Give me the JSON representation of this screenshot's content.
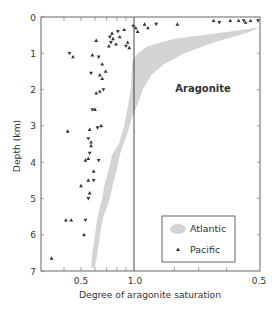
{
  "chart_data": {
    "type": "scatter",
    "title": "",
    "xlabel": "Degree of aragonite saturation",
    "ylabel": "Depth (km)",
    "ylim": [
      0,
      7
    ],
    "y_inverted": true,
    "yticks": [
      0,
      1,
      2,
      3,
      4,
      5,
      6,
      7
    ],
    "xticks_labels": [
      "0.5",
      "1.0",
      "0.5"
    ],
    "x_scale_note": "Left half: saturation 0.3–1.0 (log); right half: inverse scale 1.0→0.5 (supersaturated, Ω 1→2)",
    "reference_line": {
      "x": 1.0,
      "label": ""
    },
    "annotations": [
      {
        "text": "Aragonite",
        "x": 1.55,
        "depth": 2.0
      }
    ],
    "grid": false,
    "legend": {
      "position": "lower right",
      "entries": [
        "Atlantic",
        "Pacific"
      ]
    },
    "series": [
      {
        "name": "Atlantic",
        "kind": "band",
        "color": "#d4d4d4",
        "left_edge": [
          [
            0.3,
            1.95
          ],
          [
            0.4,
            1.7
          ],
          [
            0.6,
            1.25
          ],
          [
            0.8,
            1.08
          ],
          [
            1.0,
            1.02
          ],
          [
            1.2,
            0.98
          ],
          [
            1.5,
            0.97
          ],
          [
            2.0,
            0.96
          ],
          [
            2.5,
            0.92
          ],
          [
            3.0,
            0.88
          ],
          [
            3.5,
            0.82
          ],
          [
            3.8,
            0.75
          ],
          [
            4.2,
            0.72
          ],
          [
            4.6,
            0.68
          ],
          [
            5.0,
            0.66
          ],
          [
            5.5,
            0.62
          ],
          [
            6.0,
            0.6
          ],
          [
            6.5,
            0.58
          ],
          [
            6.9,
            0.57
          ]
        ],
        "right_edge": [
          [
            0.3,
            2.0
          ],
          [
            0.45,
            1.85
          ],
          [
            0.7,
            1.55
          ],
          [
            1.0,
            1.32
          ],
          [
            1.3,
            1.18
          ],
          [
            1.6,
            1.1
          ],
          [
            2.0,
            1.05
          ],
          [
            2.4,
            1.02
          ],
          [
            2.8,
            0.97
          ],
          [
            3.2,
            0.92
          ],
          [
            3.5,
            0.87
          ],
          [
            3.8,
            0.83
          ],
          [
            4.2,
            0.8
          ],
          [
            4.6,
            0.76
          ],
          [
            5.0,
            0.73
          ],
          [
            5.5,
            0.67
          ],
          [
            6.0,
            0.64
          ],
          [
            6.5,
            0.62
          ],
          [
            6.9,
            0.6
          ]
        ]
      },
      {
        "name": "Pacific",
        "kind": "points",
        "marker": "triangle",
        "color": "#333333",
        "points": [
          {
            "depth": 0.1,
            "omega": 1.55
          },
          {
            "depth": 0.15,
            "omega": 1.6
          },
          {
            "depth": 0.1,
            "omega": 1.7
          },
          {
            "depth": 0.1,
            "omega": 1.78
          },
          {
            "depth": 0.1,
            "omega": 1.83
          },
          {
            "depth": 0.15,
            "omega": 1.85
          },
          {
            "depth": 0.1,
            "omega": 1.9
          },
          {
            "depth": 0.1,
            "omega": 1.98
          },
          {
            "depth": 0.2,
            "omega": 1.06
          },
          {
            "depth": 0.3,
            "omega": 1.08
          },
          {
            "depth": 0.2,
            "omega": 1.13
          },
          {
            "depth": 0.2,
            "omega": 1.27
          },
          {
            "depth": 0.3,
            "omega": 1.01
          },
          {
            "depth": 0.25,
            "omega": 0.99
          },
          {
            "depth": 0.4,
            "omega": 1.02
          },
          {
            "depth": 0.35,
            "omega": 0.88
          },
          {
            "depth": 0.4,
            "omega": 0.81
          },
          {
            "depth": 0.45,
            "omega": 0.75
          },
          {
            "depth": 0.55,
            "omega": 0.83
          },
          {
            "depth": 0.55,
            "omega": 0.73
          },
          {
            "depth": 0.6,
            "omega": 0.76
          },
          {
            "depth": 0.65,
            "omega": 0.61
          },
          {
            "depth": 0.7,
            "omega": 0.74
          },
          {
            "depth": 0.7,
            "omega": 0.92
          },
          {
            "depth": 0.75,
            "omega": 0.79
          },
          {
            "depth": 0.8,
            "omega": 0.9
          },
          {
            "depth": 0.8,
            "omega": 0.72
          },
          {
            "depth": 0.85,
            "omega": 0.94
          },
          {
            "depth": 1.0,
            "omega": 0.43
          },
          {
            "depth": 1.1,
            "omega": 0.45
          },
          {
            "depth": 1.05,
            "omega": 0.58
          },
          {
            "depth": 1.1,
            "omega": 0.63
          },
          {
            "depth": 1.3,
            "omega": 0.66
          },
          {
            "depth": 1.5,
            "omega": 0.69
          },
          {
            "depth": 1.55,
            "omega": 0.57
          },
          {
            "depth": 1.6,
            "omega": 0.64
          },
          {
            "depth": 1.7,
            "omega": 0.66
          },
          {
            "depth": 2.0,
            "omega": 0.67
          },
          {
            "depth": 2.05,
            "omega": 0.64
          },
          {
            "depth": 2.1,
            "omega": 0.61
          },
          {
            "depth": 2.55,
            "omega": 0.58
          },
          {
            "depth": 2.55,
            "omega": 0.6
          },
          {
            "depth": 3.0,
            "omega": 0.65
          },
          {
            "depth": 3.05,
            "omega": 0.62
          },
          {
            "depth": 3.1,
            "omega": 0.56
          },
          {
            "depth": 3.15,
            "omega": 0.42
          },
          {
            "depth": 3.35,
            "omega": 0.55
          },
          {
            "depth": 3.45,
            "omega": 0.57
          },
          {
            "depth": 3.55,
            "omega": 0.57
          },
          {
            "depth": 3.75,
            "omega": 0.56
          },
          {
            "depth": 3.9,
            "omega": 0.55
          },
          {
            "depth": 3.95,
            "omega": 0.53
          },
          {
            "depth": 3.95,
            "omega": 0.63
          },
          {
            "depth": 4.25,
            "omega": 0.59
          },
          {
            "depth": 4.5,
            "omega": 0.55
          },
          {
            "depth": 4.5,
            "omega": 0.59
          },
          {
            "depth": 4.65,
            "omega": 0.5
          },
          {
            "depth": 4.85,
            "omega": 0.56
          },
          {
            "depth": 5.0,
            "omega": 0.55
          },
          {
            "depth": 5.6,
            "omega": 0.41
          },
          {
            "depth": 5.6,
            "omega": 0.44
          },
          {
            "depth": 5.6,
            "omega": 0.53
          },
          {
            "depth": 6.0,
            "omega": 0.52
          },
          {
            "depth": 6.65,
            "omega": 0.34
          }
        ]
      }
    ]
  },
  "labels": {
    "ylabel": "Depth (km)",
    "xlabel": "Degree of aragonite saturation",
    "annotation": "Aragonite",
    "legend_atlantic": "Atlantic",
    "legend_pacific": "Pacific",
    "xtick_left": "0.5",
    "xtick_mid": "1.0",
    "xtick_right": "0.5",
    "yticks": [
      "0",
      "1",
      "2",
      "3",
      "4",
      "5",
      "6",
      "7"
    ]
  }
}
